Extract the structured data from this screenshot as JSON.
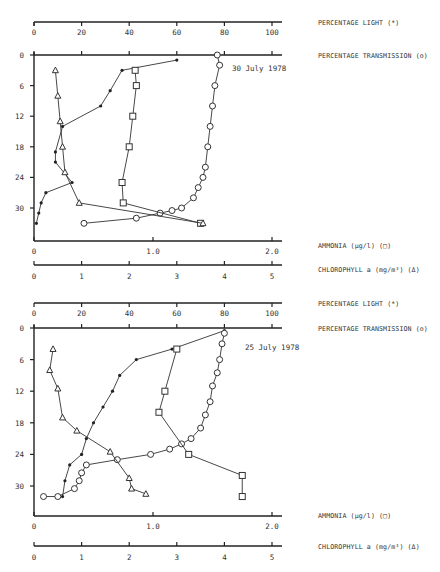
{
  "panels": [
    {
      "date": "30 July 1978",
      "axis_labels": {
        "light": "PERCENTAGE LIGHT (*)",
        "transmission": "PERCENTAGE TRANSMISSION (o)",
        "ammonia": "AMMONIA (µg/l) (□)",
        "chlorophyll": "CHLOROPHYLL a (mg/m³) (Δ)"
      }
    },
    {
      "date": "25 July 1978",
      "axis_labels": {
        "light": "PERCENTAGE LIGHT (*)",
        "transmission": "PERCENTAGE TRANSMISSION (o)",
        "ammonia": "AMMONIA (µg/l) (□)",
        "chlorophyll": "CHLOROPHYLL a (mg/m³) (Δ)"
      }
    }
  ],
  "ticks": {
    "percent": [
      "0",
      "20",
      "40",
      "60",
      "80",
      "100"
    ],
    "depth": [
      "0",
      "6",
      "12",
      "18",
      "24",
      "30"
    ],
    "ammonia": [
      "0",
      "1.0",
      "2.0"
    ],
    "chlorophyll": [
      "0",
      "1",
      "2",
      "3",
      "4",
      "5"
    ]
  },
  "chart_data": [
    {
      "type": "line",
      "title": "30 July 1978",
      "ylabel": "Depth",
      "ylim": [
        0,
        33
      ],
      "y_inverted": true,
      "yticks": [
        0,
        6,
        12,
        18,
        24,
        30
      ],
      "x_axes": [
        {
          "label": "PERCENTAGE LIGHT (*)",
          "range": [
            0,
            100
          ],
          "ticks": [
            0,
            20,
            40,
            60,
            80,
            100
          ]
        },
        {
          "label": "PERCENTAGE TRANSMISSION (o)",
          "range": [
            0,
            100
          ],
          "ticks": [
            0,
            20,
            40,
            60,
            80,
            100
          ]
        },
        {
          "label": "AMMONIA (µg/l) (□)",
          "range": [
            0,
            2.0
          ],
          "ticks": [
            0,
            1.0,
            2.0
          ]
        },
        {
          "label": "CHLOROPHYLL a (mg/m³) (Δ)",
          "range": [
            0,
            5
          ],
          "ticks": [
            0,
            1,
            2,
            3,
            4,
            5
          ]
        }
      ],
      "series": [
        {
          "name": "Percentage light",
          "marker": "*",
          "axis": "percent",
          "points": [
            [
              60,
              1
            ],
            [
              37,
              3
            ],
            [
              32,
              7
            ],
            [
              28,
              10
            ],
            [
              12,
              14
            ],
            [
              9,
              19
            ],
            [
              9,
              21
            ],
            [
              16,
              25
            ],
            [
              5,
              27
            ],
            [
              3,
              29
            ],
            [
              2,
              31
            ],
            [
              1,
              33
            ]
          ]
        },
        {
          "name": "Percentage transmission",
          "marker": "o",
          "axis": "percent",
          "points": [
            [
              77,
              0
            ],
            [
              78,
              2
            ],
            [
              76,
              6
            ],
            [
              75,
              10
            ],
            [
              74,
              14
            ],
            [
              73,
              18
            ],
            [
              72,
              22
            ],
            [
              71,
              24
            ],
            [
              69,
              26
            ],
            [
              67,
              28
            ],
            [
              62,
              30
            ],
            [
              58,
              30.5
            ],
            [
              53,
              31
            ],
            [
              43,
              32
            ],
            [
              21,
              33
            ]
          ]
        },
        {
          "name": "Ammonia",
          "marker": "square",
          "axis": "ammonia",
          "points": [
            [
              0.85,
              3
            ],
            [
              0.86,
              6
            ],
            [
              0.83,
              12
            ],
            [
              0.8,
              18
            ],
            [
              0.74,
              25
            ],
            [
              0.75,
              29
            ],
            [
              1.4,
              33
            ]
          ]
        },
        {
          "name": "Chlorophyll a",
          "marker": "triangle",
          "axis": "chlorophyll",
          "points": [
            [
              0.45,
              3
            ],
            [
              0.5,
              8
            ],
            [
              0.55,
              13
            ],
            [
              0.6,
              18
            ],
            [
              0.65,
              23
            ],
            [
              0.95,
              29
            ],
            [
              3.55,
              33
            ]
          ]
        }
      ]
    },
    {
      "type": "line",
      "title": "25 July 1978",
      "ylabel": "Depth",
      "ylim": [
        0,
        33
      ],
      "y_inverted": true,
      "yticks": [
        0,
        6,
        12,
        18,
        24,
        30
      ],
      "x_axes": [
        {
          "label": "PERCENTAGE LIGHT (*)",
          "range": [
            0,
            100
          ],
          "ticks": [
            0,
            20,
            40,
            60,
            80,
            100
          ]
        },
        {
          "label": "PERCENTAGE TRANSMISSION (o)",
          "range": [
            0,
            100
          ],
          "ticks": [
            0,
            20,
            40,
            60,
            80,
            100
          ]
        },
        {
          "label": "AMMONIA (µg/l) (□)",
          "range": [
            0,
            2.0
          ],
          "ticks": [
            0,
            1.0,
            2.0
          ]
        },
        {
          "label": "CHLOROPHYLL a (mg/m³) (Δ)",
          "range": [
            0,
            5
          ],
          "ticks": [
            0,
            1,
            2,
            3,
            4,
            5
          ]
        }
      ],
      "series": [
        {
          "name": "Percentage light",
          "marker": "*",
          "axis": "percent",
          "points": [
            [
              80,
              0.5
            ],
            [
              58,
              4
            ],
            [
              43,
              6
            ],
            [
              36,
              9
            ],
            [
              33,
              12
            ],
            [
              29,
              15
            ],
            [
              25,
              18
            ],
            [
              22,
              21
            ],
            [
              20,
              24
            ],
            [
              15,
              26
            ],
            [
              13,
              29
            ],
            [
              12,
              32
            ]
          ]
        },
        {
          "name": "Percentage transmission",
          "marker": "o",
          "axis": "percent",
          "points": [
            [
              80,
              1
            ],
            [
              79,
              3
            ],
            [
              78,
              6
            ],
            [
              77,
              8.5
            ],
            [
              75,
              11
            ],
            [
              74,
              14
            ],
            [
              72,
              16.5
            ],
            [
              70,
              19
            ],
            [
              66,
              21
            ],
            [
              62,
              22
            ],
            [
              57,
              23
            ],
            [
              49,
              24
            ],
            [
              35,
              25
            ],
            [
              22,
              26
            ],
            [
              20,
              27.5
            ],
            [
              19,
              29
            ],
            [
              17,
              30.5
            ],
            [
              10,
              32
            ],
            [
              4,
              32
            ]
          ]
        },
        {
          "name": "Ammonia",
          "marker": "square",
          "axis": "ammonia",
          "points": [
            [
              1.2,
              4
            ],
            [
              1.1,
              12
            ],
            [
              1.05,
              16
            ],
            [
              1.3,
              24
            ],
            [
              1.75,
              28
            ],
            [
              1.75,
              32
            ]
          ]
        },
        {
          "name": "Chlorophyll a",
          "marker": "triangle",
          "axis": "chlorophyll",
          "points": [
            [
              0.4,
              4
            ],
            [
              0.33,
              8
            ],
            [
              0.5,
              11.5
            ],
            [
              0.6,
              17
            ],
            [
              0.9,
              19.5
            ],
            [
              1.6,
              23.5
            ],
            [
              2.0,
              28.5
            ],
            [
              2.05,
              30.5
            ],
            [
              2.35,
              31.5
            ]
          ]
        }
      ]
    }
  ]
}
